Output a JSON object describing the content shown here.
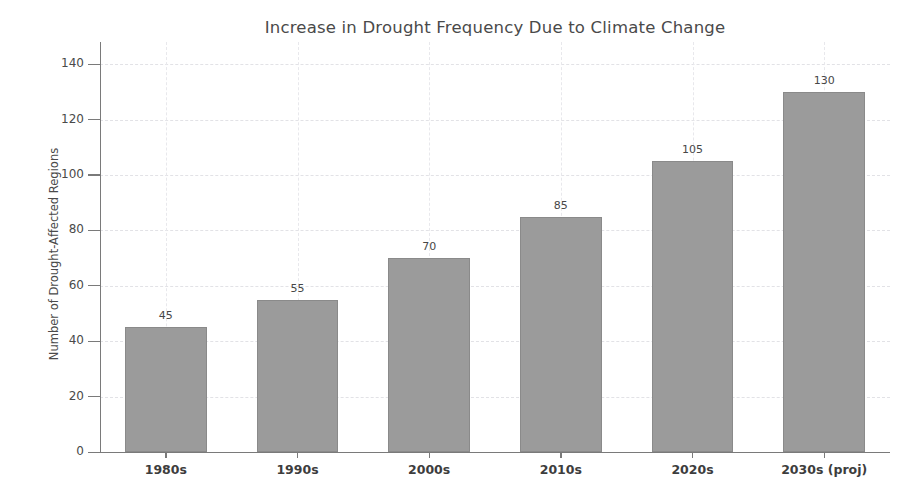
{
  "chart_data": {
    "type": "bar",
    "title": "Increase in Drought Frequency Due to Climate Change",
    "xlabel": "",
    "ylabel": "Number of Drought-Affected Regions",
    "categories": [
      "1980s",
      "1990s",
      "2000s",
      "2010s",
      "2020s",
      "2030s (proj)"
    ],
    "values": [
      45,
      55,
      70,
      85,
      105,
      130
    ],
    "value_labels": [
      "45",
      "55",
      "70",
      "85",
      "105",
      "130"
    ],
    "ylim": [
      0,
      148
    ],
    "yticks": [
      0,
      20,
      40,
      60,
      80,
      100,
      120,
      140
    ],
    "ytick_labels": [
      "0",
      "20",
      "40",
      "60",
      "80",
      "100",
      "120",
      "140"
    ],
    "grid": true,
    "legend": null,
    "bar_color": "#9b9b9b",
    "bar_edge_color": "#8a8a8a",
    "grid_color": "#e2e2e6",
    "axis_color": "#7a7a7a",
    "background_color": "#ffffff"
  }
}
